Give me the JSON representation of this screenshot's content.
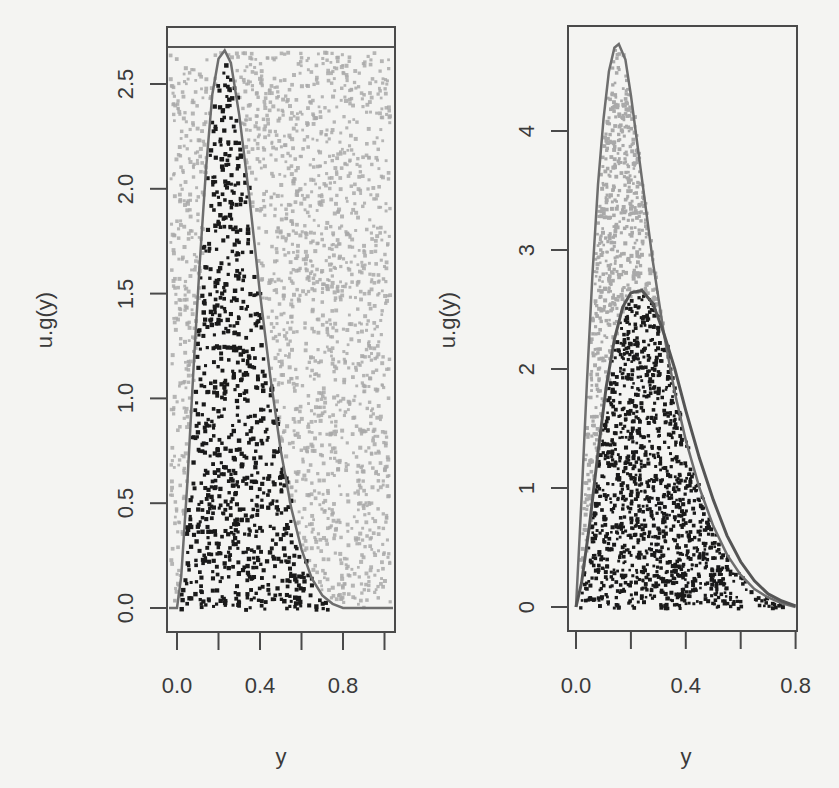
{
  "chart_data": [
    {
      "type": "scatter",
      "panel": "left",
      "title": "",
      "xlabel": "y",
      "ylabel": "u.g(y)",
      "xlim": [
        0.0,
        1.0
      ],
      "ylim": [
        0.0,
        2.68
      ],
      "x_ticks": [
        0.0,
        0.2,
        0.4,
        0.6,
        0.8,
        1.0
      ],
      "x_tick_labels": [
        "0.0",
        "",
        "0.4",
        "",
        "0.8",
        ""
      ],
      "y_ticks": [
        0.0,
        0.5,
        1.0,
        1.5,
        2.0,
        2.5
      ],
      "y_tick_labels": [
        "0.0",
        "0.5",
        "1.0",
        "1.5",
        "2.0",
        "2.5"
      ],
      "grid": false,
      "legend": null,
      "upper_bound_line": 2.68,
      "series": [
        {
          "name": "target density curve",
          "kind": "line",
          "color": "#6e6e6e",
          "x": [
            0.0,
            0.02,
            0.05,
            0.08,
            0.11,
            0.14,
            0.17,
            0.2,
            0.23,
            0.26,
            0.3,
            0.35,
            0.4,
            0.45,
            0.5,
            0.55,
            0.6,
            0.65,
            0.7,
            0.75,
            0.8,
            0.9,
            1.0
          ],
          "y": [
            0.0,
            0.15,
            0.6,
            1.15,
            1.65,
            2.1,
            2.45,
            2.62,
            2.66,
            2.6,
            2.35,
            1.95,
            1.5,
            1.1,
            0.75,
            0.48,
            0.28,
            0.14,
            0.06,
            0.02,
            0.0,
            0.0,
            0.0
          ]
        },
        {
          "name": "accepted points",
          "kind": "points",
          "color": "#1a1a1a",
          "region": "below curve"
        },
        {
          "name": "rejected points",
          "kind": "points",
          "color": "#a9a9a9",
          "region": "above curve, within envelope"
        }
      ]
    },
    {
      "type": "scatter",
      "panel": "right",
      "title": "",
      "xlabel": "y",
      "ylabel": "u.g(y)",
      "xlim": [
        0.0,
        0.8
      ],
      "ylim": [
        0.0,
        4.75
      ],
      "x_ticks": [
        0.0,
        0.2,
        0.4,
        0.6,
        0.8
      ],
      "x_tick_labels": [
        "0.0",
        "",
        "0.4",
        "",
        "0.8"
      ],
      "y_ticks": [
        0,
        1,
        2,
        3,
        4
      ],
      "y_tick_labels": [
        "0",
        "1",
        "2",
        "3",
        "4"
      ],
      "grid": false,
      "legend": null,
      "series": [
        {
          "name": "envelope curve",
          "kind": "line",
          "color": "#6e6e6e",
          "x": [
            0.0,
            0.02,
            0.04,
            0.06,
            0.08,
            0.1,
            0.12,
            0.14,
            0.156,
            0.18,
            0.2,
            0.24,
            0.28,
            0.32,
            0.36,
            0.4,
            0.45,
            0.5,
            0.55,
            0.6,
            0.65,
            0.7,
            0.75,
            0.8
          ],
          "y": [
            0.0,
            0.9,
            1.9,
            2.8,
            3.55,
            4.1,
            4.5,
            4.7,
            4.73,
            4.6,
            4.3,
            3.6,
            2.9,
            2.3,
            1.8,
            1.4,
            1.0,
            0.68,
            0.44,
            0.27,
            0.15,
            0.08,
            0.03,
            0.0
          ]
        },
        {
          "name": "target density curve",
          "kind": "line",
          "color": "#555555",
          "x": [
            0.0,
            0.02,
            0.05,
            0.08,
            0.11,
            0.14,
            0.17,
            0.2,
            0.24,
            0.28,
            0.32,
            0.36,
            0.4,
            0.45,
            0.5,
            0.55,
            0.6,
            0.65,
            0.7,
            0.75,
            0.8
          ],
          "y": [
            0.0,
            0.2,
            0.7,
            1.3,
            1.85,
            2.25,
            2.52,
            2.64,
            2.66,
            2.55,
            2.3,
            2.0,
            1.65,
            1.25,
            0.9,
            0.6,
            0.38,
            0.22,
            0.11,
            0.05,
            0.01
          ]
        },
        {
          "name": "accepted points",
          "kind": "points",
          "color": "#1a1a1a",
          "region": "below target curve"
        },
        {
          "name": "rejected points",
          "kind": "points",
          "color": "#a9a9a9",
          "region": "between target and envelope"
        }
      ]
    }
  ],
  "labels": {
    "left_ylabel": "u.g(y)",
    "left_xlabel": "y",
    "right_ylabel": "u.g(y)",
    "right_xlabel": "y",
    "left_yticks": [
      "0.0",
      "0.5",
      "1.0",
      "1.5",
      "2.0",
      "2.5"
    ],
    "left_xticks": [
      "0.0",
      "0.4",
      "0.8"
    ],
    "right_yticks": [
      "0",
      "1",
      "2",
      "3",
      "4"
    ],
    "right_xticks": [
      "0.0",
      "0.4",
      "0.8"
    ]
  },
  "colors": {
    "background": "#f4f4f2",
    "axis": "#4a4a4a",
    "accepted": "#1a1a1a",
    "rejected": "#a9a9a9",
    "curve": "#6e6e6e"
  }
}
